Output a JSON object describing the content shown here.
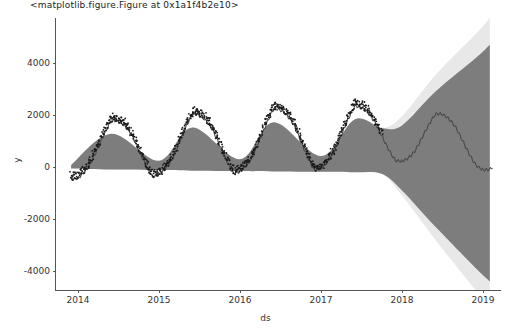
{
  "header": {
    "top_text": "<matplotlib.figure.Figure at 0x1a1f4b2e10>"
  },
  "chart_data": {
    "type": "line",
    "title": "",
    "xlabel": "ds",
    "ylabel": "y",
    "xlim": [
      "2013-09-01",
      "2019-03-01"
    ],
    "ylim": [
      -5200,
      5000
    ],
    "grid": false,
    "legend": null,
    "xticks": [
      "2014",
      "2015",
      "2016",
      "2017",
      "2018",
      "2019"
    ],
    "yticks": [
      "-4000",
      "-2000",
      "0",
      "2000",
      "4000"
    ],
    "ytick_values": [
      -4000,
      -2000,
      0,
      2000,
      4000
    ],
    "series": [
      {
        "name": "yhat",
        "type": "line",
        "color": "#4a4a4a",
        "x": [
          "2013-12-01",
          "2014-03-01",
          "2014-06-01",
          "2014-09-01",
          "2014-12-01",
          "2015-03-01",
          "2015-06-01",
          "2015-09-01",
          "2015-12-01",
          "2016-03-01",
          "2016-06-01",
          "2016-09-01",
          "2016-12-01",
          "2017-03-01",
          "2017-06-01",
          "2017-09-01",
          "2017-12-01",
          "2018-03-01",
          "2018-06-01",
          "2018-09-01",
          "2018-12-01",
          "2019-02-01"
        ],
        "values": [
          60,
          500,
          1250,
          900,
          180,
          620,
          1500,
          1100,
          300,
          760,
          1700,
          1300,
          420,
          900,
          1800,
          1400,
          800,
          950,
          1500,
          1200,
          600,
          450
        ]
      },
      {
        "name": "uncertainty_interval",
        "type": "band",
        "color": "#595959",
        "opacity": 0.75,
        "x": [
          "2013-12-01",
          "2014-06-01",
          "2015-01-01",
          "2015-06-01",
          "2016-01-01",
          "2016-06-01",
          "2017-01-01",
          "2017-06-01",
          "2017-10-01",
          "2018-01-01",
          "2018-06-01",
          "2018-12-01",
          "2019-02-01"
        ],
        "lower": [
          -60,
          -100,
          -120,
          -140,
          -150,
          -170,
          -180,
          -200,
          -260,
          -900,
          -2300,
          -3900,
          -4400
        ],
        "upper": [
          80,
          1280,
          240,
          1520,
          300,
          1720,
          420,
          1830,
          1500,
          1600,
          2900,
          4200,
          4700
        ]
      },
      {
        "name": "observed_points",
        "type": "scatter",
        "color": "#1a1a1a",
        "marker": "dot",
        "x_range": [
          "2013-12-01",
          "2017-10-01"
        ],
        "note": "dense black dots tracking upper edge of the historical band"
      }
    ]
  }
}
